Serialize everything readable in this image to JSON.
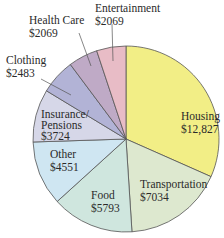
{
  "chart_data": {
    "type": "pie",
    "title": "",
    "slices": [
      {
        "label": "Housing",
        "value_label": "$12,827",
        "value": 12827,
        "color": "#f2ee86"
      },
      {
        "label": "Transportation",
        "value_label": "$7034",
        "value": 7034,
        "color": "#dde8cf"
      },
      {
        "label": "Food",
        "value_label": "$5793",
        "value": 5793,
        "color": "#cfe6de"
      },
      {
        "label": "Other",
        "value_label": "$4551",
        "value": 4551,
        "color": "#cfe6f2"
      },
      {
        "label": "Insurance/ Pensions",
        "label_lines": [
          "Insurance/",
          "Pensions"
        ],
        "value_label": "$3724",
        "value": 3724,
        "color": "#d6d7e8"
      },
      {
        "label": "Clothing",
        "value_label": "$2483",
        "value": 2483,
        "color": "#b2b3d6"
      },
      {
        "label": "Health Care",
        "value_label": "$2069",
        "value": 2069,
        "color": "#bfaac6"
      },
      {
        "label": "Entertainment",
        "value_label": "$2069",
        "value": 2069,
        "color": "#e8bcc6"
      }
    ]
  }
}
